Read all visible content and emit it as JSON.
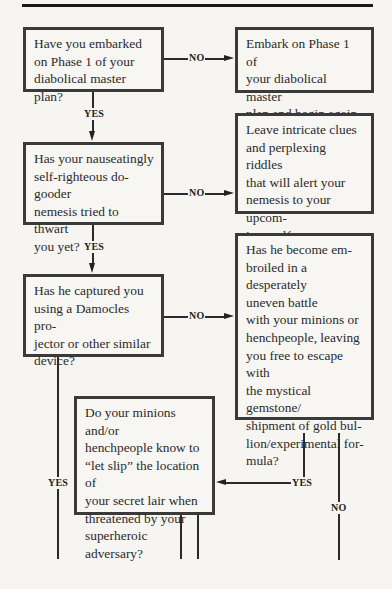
{
  "flowchart": {
    "nodes": {
      "q1": "Have you embarked\non Phase 1 of your\ndiabolical master plan?",
      "a1": "Embark on Phase 1 of\nyour diabolical master\nplan and begin again.",
      "q2": "Has your nauseatingly\nself-righteous do-gooder\nnemesis tried to thwart\nyou yet?",
      "a2": "Leave intricate clues\nand perplexing riddles\nthat will alert your\nnemesis to your upcom-\ning malfeasance.",
      "q3": "Has he captured you\nusing a Damocles pro-\njector or other similar\ndevice?",
      "q4": "Has he become em-\nbroiled in a desperately\nuneven battle\nwith your minions or\nhenchpeople, leaving\nyou free to escape with\nthe mystical gemstone/\nshipment of gold bul-\nlion/experimental for-\nmula?",
      "q5": "Do your minions and/or\nhenchpeople know to\n“let slip” the location of\nyour secret lair when\nthreatened by your\nsuperheroic adversary?"
    },
    "labels": {
      "yes": "YES",
      "no": "NO"
    },
    "edges": [
      {
        "from": "q1",
        "to": "a1",
        "label": "NO"
      },
      {
        "from": "q1",
        "to": "q2",
        "label": "YES"
      },
      {
        "from": "q2",
        "to": "a2",
        "label": "NO"
      },
      {
        "from": "q2",
        "to": "q3",
        "label": "YES"
      },
      {
        "from": "q3",
        "to": "q4",
        "label": "NO"
      },
      {
        "from": "q3",
        "to": "continues-below",
        "label": "YES"
      },
      {
        "from": "q4",
        "to": "q5",
        "label": "YES"
      },
      {
        "from": "q4",
        "to": "continues-below",
        "label": "NO"
      },
      {
        "from": "q5",
        "to": "continues-below",
        "label": ""
      }
    ]
  }
}
